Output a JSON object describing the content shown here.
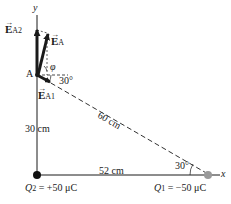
{
  "axes": {
    "x_label": "x",
    "y_label": "y"
  },
  "point_a": {
    "label": "A"
  },
  "vectors": {
    "e_a2": {
      "symbol": "E",
      "subscript": "A2"
    },
    "e_a": {
      "symbol": "E",
      "subscript": "A"
    },
    "e_a1": {
      "symbol": "E",
      "subscript": "A1"
    }
  },
  "angles": {
    "phi": "φ",
    "angle_at_a": "30°",
    "angle_at_q1": "30°"
  },
  "distances": {
    "vertical": "30 cm",
    "hypotenuse": "60 cm",
    "horizontal": "52 cm"
  },
  "charges": {
    "q2": {
      "name": "Q",
      "sub": "2",
      "value": " = +50 μC"
    },
    "q1": {
      "name": "Q",
      "sub": "1",
      "value": " = −50 μC"
    }
  },
  "colors": {
    "line": "#1a1a1a",
    "q2_dot": "#111111",
    "q1_dot": "#9a9a9a"
  }
}
